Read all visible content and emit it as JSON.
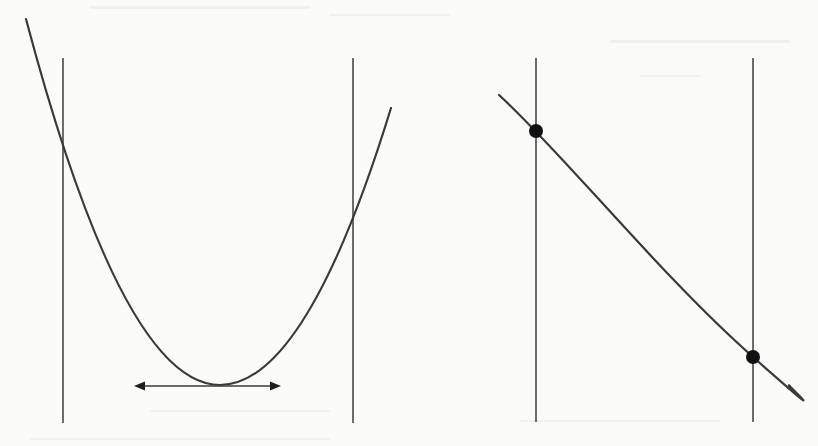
{
  "figure": {
    "colors": {
      "background": "#fbfbfa",
      "line": "#3a3a3a",
      "guide": "#4a4a4a",
      "dot": "#111111",
      "arrowhead": "#1e1e1e"
    },
    "panels": [
      {
        "id": "left",
        "bounds": [
          {
            "x": 63,
            "y_top": 58,
            "y_bottom": 423
          },
          {
            "x": 353,
            "y_top": 58,
            "y_bottom": 423
          }
        ],
        "curve": {
          "type": "parabola",
          "start": [
            26,
            19
          ],
          "vertex": [
            220,
            385
          ],
          "end": [
            391,
            108
          ],
          "crossings": [
            [
              63,
              145
            ],
            [
              353,
              213
            ]
          ]
        },
        "tangent_arrow": {
          "y": 386,
          "x_start": 135,
          "x_end": 280,
          "double_headed": true
        }
      },
      {
        "id": "right",
        "bounds": [
          {
            "x": 536,
            "y_top": 58,
            "y_bottom": 422
          },
          {
            "x": 753,
            "y_top": 58,
            "y_bottom": 422
          }
        ],
        "curve": {
          "type": "decreasing",
          "start": [
            499,
            95
          ],
          "end": [
            790,
            386
          ],
          "through": [
            [
              560,
              150
            ],
            [
              600,
              205
            ],
            [
              680,
              293
            ],
            [
              740,
              345
            ]
          ]
        },
        "points": [
          {
            "x": 536,
            "y": 131,
            "r": 7
          },
          {
            "x": 753,
            "y": 357,
            "r": 7
          }
        ]
      }
    ]
  }
}
